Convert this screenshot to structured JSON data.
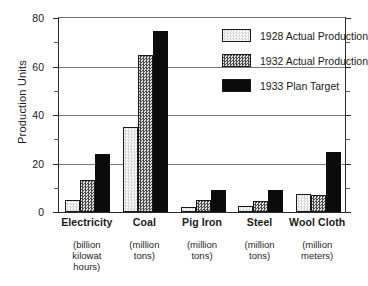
{
  "chart_data": {
    "type": "bar",
    "title": "",
    "xlabel": "",
    "ylabel": "Production Units",
    "ylim": [
      0,
      80
    ],
    "yticks": [
      0,
      20,
      40,
      60,
      80
    ],
    "yminorticks": [
      10,
      30,
      50,
      70
    ],
    "grid": "horizontal",
    "legend_position": "top-right",
    "categories": [
      "Electricity",
      "Coal",
      "Pig Iron",
      "Steel",
      "Wool Cloth"
    ],
    "category_units": [
      "(billion kilowat hours)",
      "(million tons)",
      "(million tons)",
      "(million tons)",
      "(million meters)"
    ],
    "series": [
      {
        "name": "1928 Actual Production",
        "color": "#f2f2f2",
        "values": [
          5,
          34.5,
          2,
          2.5,
          7.5
        ]
      },
      {
        "name": "1932 Actual Production",
        "color": "#9a9a9a",
        "values": [
          13,
          64,
          5,
          4.5,
          7
        ]
      },
      {
        "name": "1933 Plan Target",
        "color": "#0b0b0b",
        "values": [
          23.5,
          74,
          9,
          9,
          24.5
        ]
      }
    ]
  },
  "axis": {
    "y_title": "Production Units",
    "tick_labels": [
      "0",
      "20",
      "40",
      "60",
      "80"
    ]
  },
  "categories": [
    {
      "name": "Electricity",
      "unit_line1": "(billion",
      "unit_line2": "kilowat",
      "unit_line3": "hours)"
    },
    {
      "name": "Coal",
      "unit_line1": "(million",
      "unit_line2": "tons)",
      "unit_line3": ""
    },
    {
      "name": "Pig Iron",
      "unit_line1": "(million",
      "unit_line2": "tons)",
      "unit_line3": ""
    },
    {
      "name": "Steel",
      "unit_line1": "(million",
      "unit_line2": "tons)",
      "unit_line3": ""
    },
    {
      "name": "Wool Cloth",
      "unit_line1": "(million",
      "unit_line2": "meters)",
      "unit_line3": ""
    }
  ],
  "legend": {
    "items": [
      {
        "label": "1928 Actual Production"
      },
      {
        "label": "1932 Actual Production"
      },
      {
        "label": "1933 Plan Target"
      }
    ]
  }
}
